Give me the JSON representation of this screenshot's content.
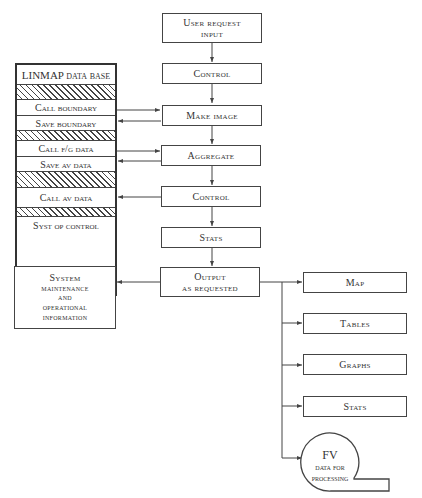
{
  "flow": {
    "user_request": [
      "User request",
      "input"
    ],
    "control_1": "Control",
    "make_image": "Make image",
    "aggregate": "Aggregate",
    "control_2": "Control",
    "stats": "Stats",
    "output": [
      "Output",
      "as requested"
    ]
  },
  "database": {
    "title": "LINMAP data base",
    "rows": [
      {
        "label": "",
        "hatched": true
      },
      {
        "label": "Call boundary"
      },
      {
        "label": "Save boundary"
      },
      {
        "label": "",
        "hatched": true
      },
      {
        "label": "Call f/g data"
      },
      {
        "label": "Save av data"
      },
      {
        "label": "",
        "hatched": true
      },
      {
        "label": "Call av data"
      },
      {
        "label": "",
        "hatched": true
      },
      {
        "label": "Syst op control"
      }
    ]
  },
  "maintenance": [
    "System",
    "maintenance",
    "and",
    "operational",
    "information"
  ],
  "outputs": {
    "map": "Map",
    "tables": "Tables",
    "graphs": "Graphs",
    "stats": "Stats",
    "fv": {
      "title": "FV",
      "line1": "data for",
      "line2": "processing"
    }
  }
}
